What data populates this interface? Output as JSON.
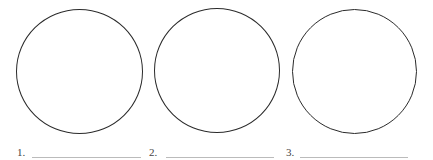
{
  "items": [
    {
      "number": "1.",
      "answer": ""
    },
    {
      "number": "2.",
      "answer": ""
    },
    {
      "number": "3.",
      "answer": ""
    }
  ]
}
